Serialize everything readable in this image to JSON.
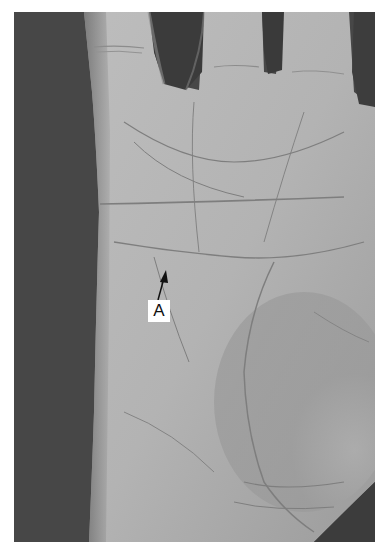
{
  "figure": {
    "type": "grayscale photograph",
    "annotation": {
      "label": "A",
      "pointer": "arrow pointing up to a crease on the palm"
    },
    "colors": {
      "background_dark": "#454545",
      "skin_light": "#b9b9b9",
      "skin_mid": "#a3a3a3",
      "crease": "#7a7a7a",
      "finger_gap": "#3a3a3a",
      "label_bg": "#ffffff",
      "label_text": "#111111"
    }
  }
}
